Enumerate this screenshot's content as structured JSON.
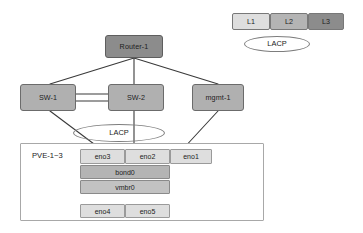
{
  "diagram": {
    "canvas": {
      "width": 363,
      "height": 233
    },
    "colors": {
      "layer1": "#dedede",
      "layer2": "#b4b4b4",
      "layer3": "#8c8c8c",
      "edge": "#3a3a3a",
      "container_border": "#a8a8a8",
      "ellipse_stroke": "#7d7d7d"
    }
  },
  "nodes": {
    "router": {
      "label": "Router-1"
    },
    "switch1": {
      "label": "SW-1"
    },
    "switch2": {
      "label": "SW-2"
    },
    "mgmt": {
      "label": "mgmt-1"
    }
  },
  "pve": {
    "label": "PVE-1~3",
    "interfaces_top": [
      {
        "label": "eno3"
      },
      {
        "label": "eno2"
      },
      {
        "label": "eno1"
      }
    ],
    "bond": {
      "label": "bond0"
    },
    "bridge": {
      "label": "vmbr0"
    },
    "interfaces_bottom": [
      {
        "label": "eno4"
      },
      {
        "label": "eno5"
      }
    ]
  },
  "lacp": {
    "diagram_label": "LACP",
    "legend_label": "LACP"
  },
  "legend": {
    "layers": [
      {
        "label": "L1"
      },
      {
        "label": "L2"
      },
      {
        "label": "L3"
      }
    ]
  }
}
